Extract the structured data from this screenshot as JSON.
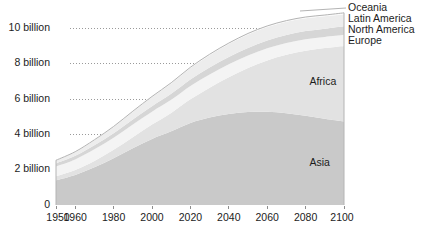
{
  "chart_data": {
    "type": "area",
    "title": "",
    "subtitle": "",
    "xlabel": "",
    "ylabel": "",
    "stacked": true,
    "grid": true,
    "legend_position": "right-inline",
    "xlim": [
      1950,
      2100
    ],
    "ylim": [
      0,
      11.6
    ],
    "x": [
      1950,
      1960,
      1970,
      1980,
      1990,
      2000,
      2010,
      2020,
      2030,
      2040,
      2050,
      2060,
      2070,
      2080,
      2090,
      2100
    ],
    "xticks": [
      1950,
      1960,
      1980,
      2000,
      2020,
      2040,
      2060,
      2080,
      2100
    ],
    "xtick_labels": [
      "1950",
      "1960",
      "1980",
      "2000",
      "2020",
      "2040",
      "2060",
      "2080",
      "2100"
    ],
    "yticks": [
      0,
      2,
      4,
      6,
      8,
      10
    ],
    "ytick_labels": [
      "0",
      "2 billion",
      "4 billion",
      "6 billion",
      "8 billion",
      "10 billion"
    ],
    "series": [
      {
        "name": "Asia",
        "color": "#c9c9c9",
        "label_x": 2082,
        "label_y": 2.35,
        "values": [
          1.4,
          1.7,
          2.13,
          2.64,
          3.21,
          3.74,
          4.17,
          4.64,
          4.95,
          5.15,
          5.26,
          5.27,
          5.19,
          5.05,
          4.88,
          4.72
        ]
      },
      {
        "name": "Africa",
        "color": "#e2e2e2",
        "label_x": 2082,
        "label_y": 6.95,
        "values": [
          0.23,
          0.28,
          0.36,
          0.48,
          0.63,
          0.81,
          1.04,
          1.34,
          1.69,
          2.08,
          2.49,
          2.91,
          3.31,
          3.68,
          4.0,
          4.28
        ]
      },
      {
        "name": "Europe",
        "color": "#f4f4f4",
        "label_x": 2103,
        "label_y": 10.42,
        "values": [
          0.55,
          0.6,
          0.66,
          0.69,
          0.72,
          0.73,
          0.74,
          0.75,
          0.74,
          0.73,
          0.71,
          0.69,
          0.67,
          0.65,
          0.63,
          0.63
        ]
      },
      {
        "name": "North America",
        "color": "#d6d6d6",
        "label_x": 2103,
        "label_y": 10.95,
        "values": [
          0.17,
          0.2,
          0.23,
          0.25,
          0.28,
          0.31,
          0.34,
          0.37,
          0.4,
          0.42,
          0.43,
          0.44,
          0.45,
          0.46,
          0.47,
          0.49
        ]
      },
      {
        "name": "Latin America",
        "color": "#ededed",
        "label_x": 2103,
        "label_y": 11.48,
        "values": [
          0.17,
          0.22,
          0.29,
          0.36,
          0.44,
          0.52,
          0.59,
          0.65,
          0.7,
          0.73,
          0.76,
          0.76,
          0.75,
          0.73,
          0.7,
          0.68
        ]
      },
      {
        "name": "Oceania",
        "color": "#fafafa",
        "label_x": 2103,
        "label_y": 12.02,
        "values": [
          0.013,
          0.016,
          0.02,
          0.023,
          0.027,
          0.031,
          0.037,
          0.043,
          0.048,
          0.053,
          0.057,
          0.061,
          0.064,
          0.067,
          0.07,
          0.073
        ]
      }
    ]
  },
  "axis": {
    "baseline_label": "0"
  },
  "colors": {
    "gridline": "#9a9a9a",
    "text": "#1c1c1c",
    "outline": "#b4b4b4",
    "plot_background": "#ffffff"
  }
}
